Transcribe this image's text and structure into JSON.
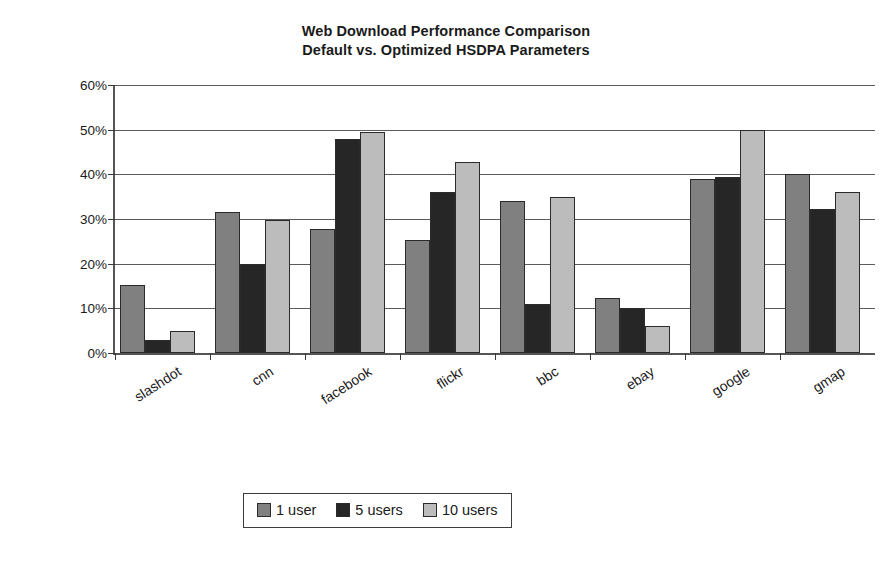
{
  "chart_data": {
    "type": "bar",
    "title": "Web Download Performance Comparison",
    "subtitle": "Default vs. Optimized HSDPA Parameters",
    "xlabel": "",
    "ylabel": "Performance gain (%)",
    "ylim": [
      0,
      60
    ],
    "ytick_labels": [
      "0%",
      "10%",
      "20%",
      "30%",
      "40%",
      "50%",
      "60%"
    ],
    "ytick_values": [
      0,
      10,
      20,
      30,
      40,
      50,
      60
    ],
    "grid": true,
    "legend_position": "bottom",
    "categories": [
      "slashdot",
      "cnn",
      "facebook",
      "flickr",
      "bbc",
      "ebay",
      "google",
      "gmap"
    ],
    "series": [
      {
        "name": "1 user",
        "color": "#808080",
        "values": [
          15.3,
          31.5,
          27.7,
          25.3,
          34.0,
          12.3,
          39.0,
          40.0
        ]
      },
      {
        "name": "5 users",
        "color": "#262626",
        "values": [
          3.0,
          20.0,
          48.0,
          36.0,
          11.0,
          10.0,
          39.5,
          32.3
        ]
      },
      {
        "name": "10 users",
        "color": "#bcbcbc",
        "values": [
          5.0,
          29.7,
          49.5,
          42.7,
          35.0,
          6.0,
          50.0,
          36.0
        ]
      }
    ]
  }
}
